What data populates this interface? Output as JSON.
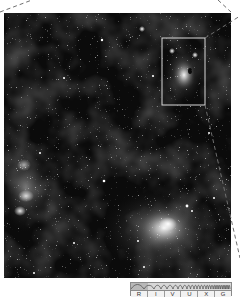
{
  "figure": {
    "inset_box": {
      "x": 162,
      "y": 38,
      "width": 43,
      "height": 67,
      "color": "#d9d9d9"
    },
    "colors": {
      "background": "#ffffff",
      "sky": "#0b0b0b",
      "nebula": "#bdbdbd",
      "box": "#d9d9d9",
      "dashed_line": "#6f6f6f"
    }
  },
  "spectrum": {
    "bands": [
      "R",
      "I",
      "V",
      "U",
      "X",
      "G"
    ],
    "highlighted_band_index": 0
  }
}
